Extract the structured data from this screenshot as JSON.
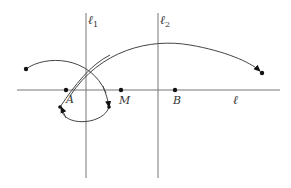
{
  "diagram": {
    "lines": {
      "horizontal": {
        "label": "ℓ"
      },
      "vertical_1": {
        "label": "ℓ",
        "subscript": "1"
      },
      "vertical_2": {
        "label": "ℓ",
        "subscript": "2"
      }
    },
    "points": {
      "A": {
        "label": "A"
      },
      "M": {
        "label": "M"
      },
      "B": {
        "label": "B"
      }
    },
    "colors": {
      "line": "#777777",
      "arc": "#444444",
      "point": "#111111"
    }
  }
}
